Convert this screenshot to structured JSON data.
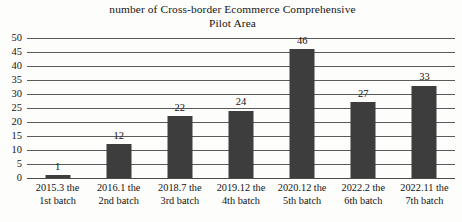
{
  "chart_data": {
    "type": "bar",
    "title": "number of Cross-border Ecommerce Comprehensive Pilot Area",
    "title_lines": [
      "number of Cross-border Ecommerce Comprehensive",
      "Pilot Area"
    ],
    "categories": [
      "2015.3 the 1st batch",
      "2016.1 the 2nd batch",
      "2018.7 the 3rd batch",
      "2019.12 the 4th batch",
      "2020.12 the 5th batch",
      "2022.2 the 6th batch",
      "2022.11 the 7th batch"
    ],
    "category_lines": [
      [
        "2015.3 the",
        "1st batch"
      ],
      [
        "2016.1 the",
        "2nd batch"
      ],
      [
        "2018.7 the",
        "3rd batch"
      ],
      [
        "2019.12 the",
        "4th batch"
      ],
      [
        "2020.12 the",
        "5th batch"
      ],
      [
        "2022.2 the",
        "6th batch"
      ],
      [
        "2022.11 the",
        "7th batch"
      ]
    ],
    "values": [
      1,
      12,
      22,
      24,
      46,
      27,
      33
    ],
    "data_labels": [
      "1",
      "12",
      "22",
      "24",
      "46",
      "27",
      "33"
    ],
    "xlabel": "",
    "ylabel": "",
    "ylim": [
      0,
      50
    ],
    "ytick_step": 5,
    "yticks": [
      0,
      5,
      10,
      15,
      20,
      25,
      30,
      35,
      40,
      45,
      50
    ],
    "ytick_labels": [
      "0",
      "5",
      "10",
      "15",
      "20",
      "25",
      "30",
      "35",
      "40",
      "45",
      "50"
    ],
    "grid": true,
    "grid_axis": "y",
    "legend": false,
    "legend_position": "none",
    "bar_color": "#3d3d3d",
    "grid_color": "#5a5a5a",
    "background_color": "#fdfdfc",
    "text_color": "#141414"
  }
}
